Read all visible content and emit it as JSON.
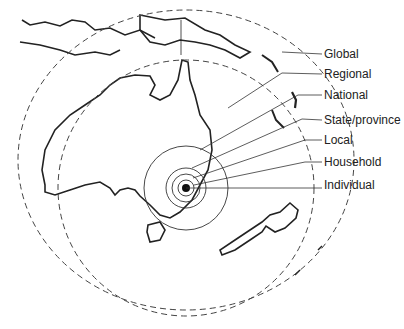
{
  "diagram": {
    "labels": [
      {
        "text": "Global",
        "y": 47
      },
      {
        "text": "Regional",
        "y": 67
      },
      {
        "text": "National",
        "y": 88
      },
      {
        "text": "State/province",
        "y": 113
      },
      {
        "text": "Local",
        "y": 133
      },
      {
        "text": "Household",
        "y": 153
      },
      {
        "text": "Individual",
        "y": 177
      }
    ]
  }
}
